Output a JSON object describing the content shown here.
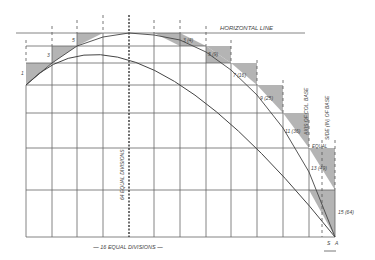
{
  "diagram": {
    "title_line": "HORIZONTAL LINE",
    "bottom_label": "— 16 EQUAL DIVISIONS —",
    "center_vertical_label": "64 EQUAL DIVISIONS",
    "right_labels": [
      "AXIS OF COL. BASE",
      "SIDE (IN) OF BASE"
    ],
    "equal_label": "EQUAL",
    "bottom_points": [
      "S",
      "A"
    ],
    "left_step_labels": [
      "1",
      "3",
      "5"
    ],
    "right_step_labels": [
      "3 (4)",
      "5 (9)",
      "7 (16)",
      "9 (25)",
      "11 (36)",
      "13 (49)",
      "15 (64)"
    ],
    "colors": {
      "line": "#555555",
      "shade": "#9a9a9a",
      "background": "#ffffff"
    }
  }
}
